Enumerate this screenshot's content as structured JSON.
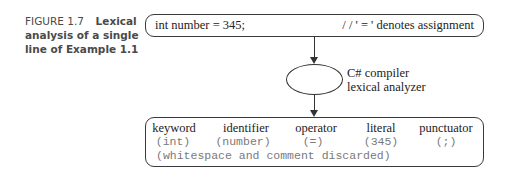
{
  "caption": {
    "number": "FIGURE 1.7",
    "title": "Lexical analysis of a single line of Example 1.1"
  },
  "input_box": {
    "code": "int number = 345;",
    "comment": "/ / ' = ' denotes assignment"
  },
  "processor": {
    "line1": "C# compiler",
    "line2": "lexical analyzer"
  },
  "output_box": {
    "tokens": [
      {
        "category": "keyword",
        "value": "(int)"
      },
      {
        "category": "identifier",
        "value": "(number)"
      },
      {
        "category": "operator",
        "value": "(=)"
      },
      {
        "category": "literal",
        "value": "(345)"
      },
      {
        "category": "punctuator",
        "value": "(;)"
      }
    ],
    "note": "(whitespace and comment discarded)"
  },
  "colors": {
    "line": "#333333",
    "caption": "#4a4a4a",
    "mono_text": "#7a7a7a"
  }
}
